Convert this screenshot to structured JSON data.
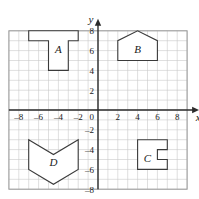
{
  "figure": {
    "background_color": "#ffffff",
    "grid_color": "#c9c9c9",
    "axis_color": "#2b2b2b",
    "shape_stroke_color": "#3a3a3a",
    "shape_fill_color": "#ffffff",
    "border_color": "#9a9a9a"
  },
  "axes": {
    "x_label": "x",
    "y_label": "y",
    "origin_label": "0",
    "x_min": -9,
    "x_max": 9,
    "y_min": -8,
    "y_max": 8,
    "unit_px": 9.9,
    "origin_px": {
      "x": 98,
      "y": 110
    },
    "x_ticks": [
      {
        "value": -8,
        "label": "–8"
      },
      {
        "value": -6,
        "label": "–6"
      },
      {
        "value": -4,
        "label": "–4"
      },
      {
        "value": -2,
        "label": "–2"
      },
      {
        "value": 2,
        "label": "2"
      },
      {
        "value": 4,
        "label": "4"
      },
      {
        "value": 6,
        "label": "6"
      },
      {
        "value": 8,
        "label": "8"
      }
    ],
    "y_ticks": [
      {
        "value": 8,
        "label": "8"
      },
      {
        "value": 6,
        "label": "6"
      },
      {
        "value": 4,
        "label": "4"
      },
      {
        "value": 2,
        "label": "2"
      },
      {
        "value": -2,
        "label": "–2"
      },
      {
        "value": -4,
        "label": "–4"
      },
      {
        "value": -6,
        "label": "–6"
      },
      {
        "value": -8,
        "label": "–8"
      }
    ]
  },
  "chart_data": {
    "type": "scatter",
    "xlabel": "x",
    "ylabel": "y",
    "xlim": [
      -9,
      9
    ],
    "ylim": [
      -8,
      8
    ],
    "grid": true,
    "legend": "none",
    "x_ticks": [
      -8,
      -6,
      -4,
      -2,
      0,
      2,
      4,
      6,
      8
    ],
    "y_ticks": [
      -8,
      -6,
      -4,
      -2,
      0,
      2,
      4,
      6,
      8
    ],
    "annotations": [
      "A",
      "B",
      "C",
      "D"
    ],
    "shapes": [
      {
        "name": "A",
        "description": "T-shaped polygon in quadrant II",
        "label_position": {
          "x": -4,
          "y": 6.2
        },
        "vertices": [
          [
            -7,
            8
          ],
          [
            -2,
            8
          ],
          [
            -2,
            7
          ],
          [
            -3,
            7
          ],
          [
            -3,
            4
          ],
          [
            -5,
            4
          ],
          [
            -5,
            7
          ],
          [
            -7,
            7
          ]
        ]
      },
      {
        "name": "B",
        "description": "House-shaped pentagon in quadrant I",
        "label_position": {
          "x": 4,
          "y": 6.2
        },
        "vertices": [
          [
            2,
            5
          ],
          [
            2,
            7
          ],
          [
            4,
            8
          ],
          [
            6,
            7
          ],
          [
            6,
            5
          ]
        ]
      },
      {
        "name": "C",
        "description": "Square with notch cut from right side in quadrant IV",
        "label_position": {
          "x": 5,
          "y": -4.8
        },
        "vertices": [
          [
            4,
            -3
          ],
          [
            7,
            -3
          ],
          [
            7,
            -4
          ],
          [
            6,
            -4
          ],
          [
            6,
            -5
          ],
          [
            7,
            -5
          ],
          [
            7,
            -6
          ],
          [
            4,
            -6
          ]
        ]
      },
      {
        "name": "D",
        "description": "Chevron / arrow-shaped polygon in quadrant III",
        "label_position": {
          "x": -4.5,
          "y": -5.3
        },
        "vertices": [
          [
            -7,
            -3
          ],
          [
            -4.5,
            -4.5
          ],
          [
            -2,
            -3
          ],
          [
            -2,
            -6
          ],
          [
            -4.5,
            -7.5
          ],
          [
            -7,
            -6
          ]
        ]
      }
    ]
  }
}
